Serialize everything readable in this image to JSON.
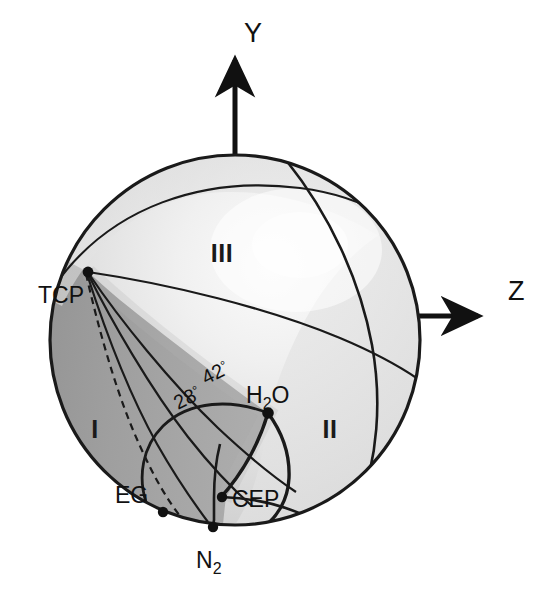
{
  "figure": {
    "type": "sphere-phase-diagram",
    "background_color": "#ffffff",
    "outline_color": "#1a1a1a"
  },
  "axes": [
    {
      "name": "y-axis",
      "label": "Y",
      "direction": "up",
      "label_x": 244,
      "label_y": 42,
      "arrow": "barbed-arrowhead"
    },
    {
      "name": "z-axis",
      "label": "Z",
      "direction": "right",
      "label_x": 508,
      "label_y": 300,
      "arrow": "barbed-arrowhead"
    }
  ],
  "sphere": {
    "center_x": 235,
    "center_y": 340,
    "radius": 185,
    "shade_dark": "#9a9a9a",
    "shade_mid": "#cfcfcf",
    "shade_light": "#e6e6e6",
    "shade_highlight": "#f7f7f7"
  },
  "regions": [
    {
      "id": "region-1",
      "label": "I",
      "x": 95,
      "y": 438
    },
    {
      "id": "region-2",
      "label": "II",
      "x": 330,
      "y": 438
    },
    {
      "id": "region-3",
      "label": "III",
      "x": 222,
      "y": 262
    }
  ],
  "points": [
    {
      "id": "tcp",
      "label": "TCP",
      "dot_x": 88,
      "dot_y": 272,
      "label_x": 38,
      "label_y": 303
    },
    {
      "id": "h2o",
      "label": "H",
      "sub": "2",
      "tail": "O",
      "dot_x": 268,
      "dot_y": 413,
      "label_x": 246,
      "label_y": 403
    },
    {
      "id": "eg",
      "label": "EG",
      "dot_x": 163,
      "dot_y": 512,
      "label_x": 115,
      "label_y": 503
    },
    {
      "id": "cep",
      "label": "CEP",
      "dot_x": 222,
      "dot_y": 497,
      "label_x": 232,
      "label_y": 507
    },
    {
      "id": "n2",
      "label": "N",
      "sub": "2",
      "dot_x": 213,
      "dot_y": 527,
      "label_x": 196,
      "label_y": 568
    }
  ],
  "angles": [
    {
      "id": "angle-42",
      "value": "42",
      "unit": "°",
      "x": 206,
      "y": 385,
      "rotation": -27
    },
    {
      "id": "angle-28",
      "value": "28",
      "unit": "°",
      "x": 178,
      "y": 410,
      "rotation": -27
    }
  ],
  "curves": {
    "dashed_description": "dashed critical line from TCP to EG",
    "solid_count": 3
  }
}
